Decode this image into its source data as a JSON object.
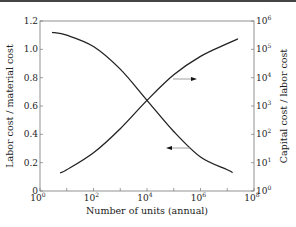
{
  "chart_data": {
    "type": "line",
    "title": "",
    "xlabel": "Number of units (annual)",
    "ylabel_left": "Labor cost / material cost",
    "ylabel_right": "Capital cost / labor cost",
    "x_scale": "log",
    "xlim": [
      1,
      100000000
    ],
    "x_ticks": [
      {
        "base": "10",
        "exp": "0"
      },
      {
        "base": "10",
        "exp": "2"
      },
      {
        "base": "10",
        "exp": "4"
      },
      {
        "base": "10",
        "exp": "6"
      },
      {
        "base": "10",
        "exp": "8"
      }
    ],
    "ylim_left": [
      0,
      1.2
    ],
    "y_ticks_left": [
      "0",
      "0.2",
      "0.4",
      "0.6",
      "0.8",
      "1.0",
      "1.2"
    ],
    "y_scale_right": "log",
    "ylim_right": [
      1,
      1000000
    ],
    "y_ticks_right": [
      {
        "base": "10",
        "exp": "0"
      },
      {
        "base": "10",
        "exp": "1"
      },
      {
        "base": "10",
        "exp": "2"
      },
      {
        "base": "10",
        "exp": "3"
      },
      {
        "base": "10",
        "exp": "4"
      },
      {
        "base": "10",
        "exp": "5"
      },
      {
        "base": "10",
        "exp": "6"
      }
    ],
    "grid": false,
    "legend": "none (arrows indicate axis)",
    "series": [
      {
        "name": "Labor cost / material cost",
        "axis": "left",
        "arrow": "left",
        "x_log10": [
          0.45,
          1.0,
          2.0,
          3.0,
          4.0,
          5.0,
          6.0,
          7.0,
          7.2
        ],
        "values": [
          1.12,
          1.1,
          1.02,
          0.86,
          0.64,
          0.42,
          0.24,
          0.15,
          0.13
        ]
      },
      {
        "name": "Capital cost / labor cost",
        "axis": "right",
        "arrow": "right",
        "x_log10": [
          0.75,
          1.0,
          2.0,
          3.0,
          4.0,
          5.0,
          6.0,
          7.0,
          7.4
        ],
        "y_log10": [
          0.64,
          0.75,
          1.35,
          2.2,
          3.2,
          4.1,
          4.75,
          5.2,
          5.37
        ]
      }
    ],
    "crossing_point": {
      "x": 10000,
      "left_value": 0.64
    }
  }
}
